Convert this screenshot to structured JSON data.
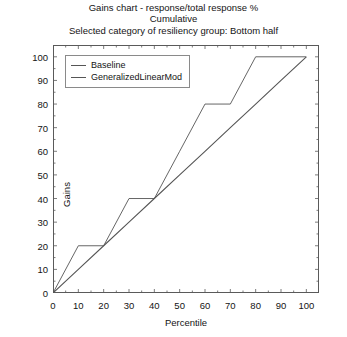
{
  "title": {
    "line1": "Gains chart - response/total response %",
    "line2": "Cumulative",
    "line3": "Selected category of resiliency group: Bottom half"
  },
  "chart_data": {
    "type": "line",
    "title": "Gains chart - response/total response % Cumulative Selected category of resiliency group: Bottom half",
    "xlabel": "Percentile",
    "ylabel": "Gains",
    "xlim": [
      0,
      105
    ],
    "ylim": [
      0,
      105
    ],
    "xticks": [
      0,
      10,
      20,
      30,
      40,
      50,
      60,
      70,
      80,
      90,
      100
    ],
    "yticks": [
      0,
      10,
      20,
      30,
      40,
      50,
      60,
      70,
      80,
      90,
      100
    ],
    "grid": false,
    "legend_position": "top-left",
    "line_color": "#555555",
    "series": [
      {
        "name": "Baseline",
        "x": [
          0,
          10,
          20,
          30,
          40,
          50,
          60,
          70,
          80,
          90,
          100
        ],
        "values": [
          0,
          10,
          20,
          30,
          40,
          50,
          60,
          70,
          80,
          90,
          100
        ]
      },
      {
        "name": "GeneralizedLinearMod",
        "x": [
          0,
          10,
          20,
          30,
          40,
          50,
          60,
          70,
          80,
          90,
          100
        ],
        "values": [
          0,
          20,
          20,
          40,
          40,
          60,
          80,
          80,
          100,
          100,
          100
        ]
      }
    ]
  },
  "legend": {
    "items": [
      {
        "label": "Baseline"
      },
      {
        "label": "GeneralizedLinearMod"
      }
    ]
  }
}
